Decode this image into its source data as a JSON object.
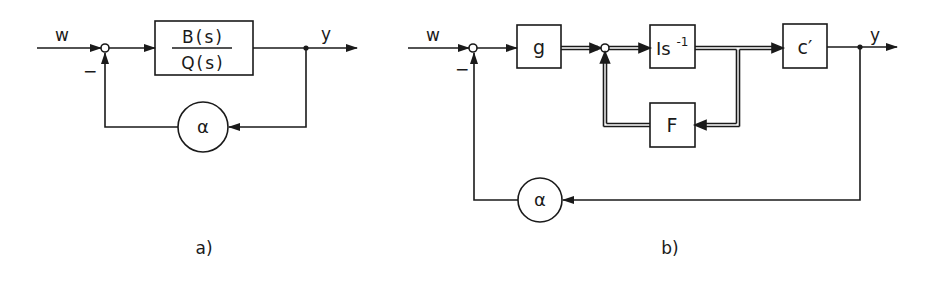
{
  "diagram_a": {
    "caption": "a)",
    "input_label": "w",
    "output_label": "y",
    "minus_sign": "−",
    "plant_numerator": "B(s)",
    "plant_denominator": "Q(s)",
    "feedback_gain": "α"
  },
  "diagram_b": {
    "caption": "b)",
    "input_label": "w",
    "output_label": "y",
    "minus_sign": "−",
    "gain_block": "g",
    "integrator_block": "Is",
    "integrator_exponent": "-1",
    "state_feedback_block": "F",
    "output_block": "c′",
    "feedback_gain": "α"
  },
  "colors": {
    "line": "#1a1a1a",
    "background": "#ffffff"
  }
}
